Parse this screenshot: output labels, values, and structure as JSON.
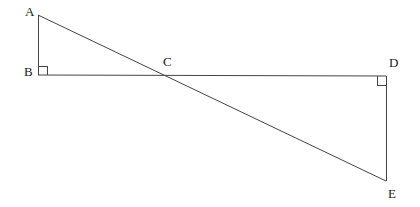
{
  "figure": {
    "kind": "geometry-diagram",
    "canvas": {
      "width": 420,
      "height": 207
    },
    "background_color": "#ffffff",
    "stroke_color": "#444444",
    "label_color": "#1a1a1a",
    "stroke_width": 1
  },
  "points": [
    {
      "name": "A",
      "label": "A",
      "x": 38,
      "y": 15,
      "label_x": 25,
      "label_y": 5
    },
    {
      "name": "B",
      "label": "B",
      "x": 38,
      "y": 75,
      "label_x": 24,
      "label_y": 65
    },
    {
      "name": "C",
      "label": "C",
      "x": 167,
      "y": 75,
      "label_x": 163,
      "label_y": 55
    },
    {
      "name": "D",
      "label": "D",
      "x": 386,
      "y": 76,
      "label_x": 389,
      "label_y": 56
    },
    {
      "name": "E",
      "label": "E",
      "x": 386,
      "y": 181,
      "label_x": 388,
      "label_y": 187
    }
  ],
  "segments": [
    {
      "name": "segment-AB",
      "from": "A",
      "to": "B",
      "x1": 38,
      "y1": 15,
      "x2": 38,
      "y2": 75
    },
    {
      "name": "segment-BD",
      "from": "B",
      "to": "D",
      "x1": 38,
      "y1": 75,
      "x2": 386,
      "y2": 76
    },
    {
      "name": "segment-DE",
      "from": "D",
      "to": "E",
      "x1": 386,
      "y1": 76,
      "x2": 386,
      "y2": 181
    },
    {
      "name": "segment-AE",
      "from": "A",
      "to": "E",
      "x1": 38,
      "y1": 15,
      "x2": 386,
      "y2": 181
    }
  ],
  "right_angle_markers": [
    {
      "name": "right-angle-at-B",
      "at": "B",
      "path": "M 38 66 L 47 66 L 47 75"
    },
    {
      "name": "right-angle-at-D",
      "at": "D",
      "path": "M 377 76 L 377 85 L 386 85"
    }
  ]
}
